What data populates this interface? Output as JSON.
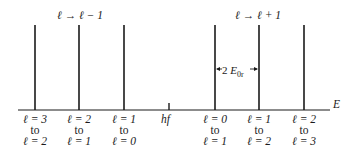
{
  "diagram": {
    "axis_label": "E",
    "center_label": "hf",
    "left_group_label": {
      "from": "ℓ",
      "arrow": "→",
      "to": "ℓ − 1"
    },
    "right_group_label": {
      "from": "ℓ",
      "arrow": "→",
      "to": "ℓ + 1"
    },
    "spacing_label": {
      "prefix": "2 ",
      "symbol": "E",
      "subscript": "0r"
    },
    "lines": [
      {
        "x": 35,
        "top": "ℓ = 3",
        "mid": "to",
        "bottom": "ℓ = 2"
      },
      {
        "x": 79,
        "top": "ℓ = 2",
        "mid": "to",
        "bottom": "ℓ = 1"
      },
      {
        "x": 124,
        "top": "ℓ = 1",
        "mid": "to",
        "bottom": "ℓ = 0"
      },
      {
        "x": 215,
        "top": "ℓ = 0",
        "mid": "to",
        "bottom": "ℓ = 1"
      },
      {
        "x": 259,
        "top": "ℓ = 1",
        "mid": "to",
        "bottom": "ℓ = 2"
      },
      {
        "x": 304,
        "top": "ℓ = 2",
        "mid": "to",
        "bottom": "ℓ = 3"
      }
    ],
    "hf_tick_x": 169
  }
}
